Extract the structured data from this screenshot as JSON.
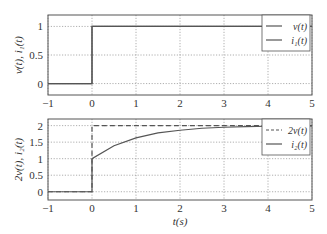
{
  "chart_data": [
    {
      "type": "line",
      "title": "",
      "xlabel": "",
      "ylabel": "v(t), i1(t)",
      "xlim": [
        -1,
        5
      ],
      "ylim": [
        -0.2,
        1.2
      ],
      "xticks": [
        "-1",
        "0",
        "1",
        "2",
        "3",
        "4",
        "5"
      ],
      "yticks": [
        "0",
        "0.5",
        "1"
      ],
      "grid": true,
      "legend_position": "upper right",
      "series": [
        {
          "name": "v(t)",
          "style": "solid",
          "x": [
            -1,
            0,
            0,
            5
          ],
          "values": [
            0,
            0,
            1,
            1
          ]
        },
        {
          "name": "i1(t)",
          "style": "solid",
          "x": [
            -1,
            0,
            0,
            5
          ],
          "values": [
            0,
            0,
            1,
            1
          ]
        }
      ]
    },
    {
      "type": "line",
      "title": "",
      "xlabel": "t(s)",
      "ylabel": "2v(t), i2(t)",
      "xlim": [
        -1,
        5
      ],
      "ylim": [
        -0.25,
        2.2
      ],
      "xticks": [
        "-1",
        "0",
        "1",
        "2",
        "3",
        "4",
        "5"
      ],
      "yticks": [
        "0",
        "0.5",
        "1",
        "1.5",
        "2"
      ],
      "grid": true,
      "legend_position": "upper right",
      "series": [
        {
          "name": "2v(t)",
          "style": "dashed",
          "x": [
            -1,
            0,
            0,
            5
          ],
          "values": [
            0,
            0,
            2,
            2
          ]
        },
        {
          "name": "i2(t)",
          "style": "solid",
          "x": [
            -1,
            0,
            0,
            0.5,
            1,
            1.5,
            2,
            2.5,
            3,
            3.5,
            4,
            4.5,
            5
          ],
          "values": [
            0,
            0,
            1.0,
            1.39,
            1.63,
            1.78,
            1.86,
            1.92,
            1.95,
            1.97,
            1.98,
            1.99,
            1.99
          ]
        }
      ]
    }
  ],
  "labels": {
    "top_ylabel": "v(t), i₁(t)",
    "bottom_ylabel": "2v(t), i₂(t)",
    "xlabel": "t(s)",
    "top_legend": [
      "v(t)",
      "i₁(t)"
    ],
    "bottom_legend": [
      "2v(t)",
      "i₂(t)"
    ],
    "xticks": [
      "−1",
      "0",
      "1",
      "2",
      "3",
      "4",
      "5"
    ],
    "top_yticks": [
      "0",
      "0.5",
      "1"
    ],
    "bottom_yticks": [
      "0",
      "0.5",
      "1",
      "1.5",
      "2"
    ]
  },
  "colors": {
    "line": "#555555",
    "grid": "#9a9a9a",
    "axes": "#555555"
  }
}
